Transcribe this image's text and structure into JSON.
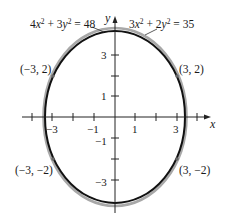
{
  "diagram": {
    "title": "",
    "axes": {
      "x_label": "x",
      "y_label": "y",
      "x_ticks": [
        {
          "value": -4,
          "label": ""
        },
        {
          "value": -3,
          "label": "−3"
        },
        {
          "value": -2,
          "label": ""
        },
        {
          "value": -1,
          "label": "−1"
        },
        {
          "value": 1,
          "label": "1"
        },
        {
          "value": 2,
          "label": ""
        },
        {
          "value": 3,
          "label": "3"
        },
        {
          "value": 4,
          "label": ""
        }
      ],
      "y_ticks": [
        {
          "value": 3,
          "label": "3"
        },
        {
          "value": 2,
          "label": ""
        },
        {
          "value": 1,
          "label": "1"
        },
        {
          "value": -1,
          "label": "−1"
        },
        {
          "value": -2,
          "label": ""
        },
        {
          "value": -3,
          "label": "−3"
        }
      ]
    },
    "curves": [
      {
        "name": "ellipse-gray",
        "equation_parts": [
          "4",
          "x",
          "2",
          " + 3",
          "y",
          "2",
          " = 48"
        ],
        "equation": "4x² + 3y² = 48",
        "color": "#a0a0a0"
      },
      {
        "name": "ellipse-black",
        "equation_parts": [
          "3",
          "x",
          "2",
          " + 2",
          "y",
          "2",
          " = 35"
        ],
        "equation": "3x² + 2y² = 35",
        "color": "#111111"
      }
    ],
    "points": [
      {
        "label": "(−3, 2)",
        "x": -3,
        "y": 2
      },
      {
        "label": "(3, 2)",
        "x": 3,
        "y": 2
      },
      {
        "label": "(−3, −2)",
        "x": -3,
        "y": -2
      },
      {
        "label": "(3, −2)",
        "x": 3,
        "y": -2
      }
    ]
  }
}
